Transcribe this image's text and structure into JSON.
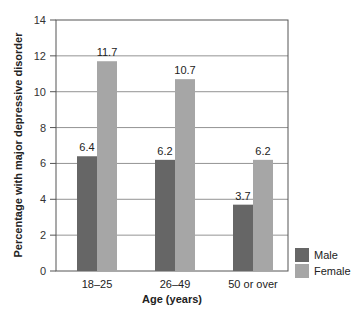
{
  "chart_data": {
    "type": "bar",
    "title": "",
    "xlabel": "Age (years)",
    "ylabel": "Percentage with major depressive disorder",
    "categories": [
      "18–25",
      "26–49",
      "50 or over"
    ],
    "series": [
      {
        "name": "Male",
        "values": [
          6.4,
          6.2,
          3.7
        ],
        "color": "#666666"
      },
      {
        "name": "Female",
        "values": [
          11.7,
          10.7,
          6.2
        ],
        "color": "#a6a6a6"
      }
    ],
    "ylim": [
      0,
      14
    ],
    "yticks": [
      0,
      2,
      4,
      6,
      8,
      10,
      12,
      14
    ],
    "grid": true,
    "legend_position": "right-bottom"
  }
}
